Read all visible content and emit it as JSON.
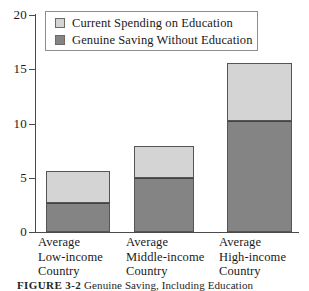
{
  "chart_data": {
    "type": "bar",
    "subtype": "stacked",
    "title": "",
    "xlabel": "",
    "ylabel": "",
    "ylim": [
      0,
      20
    ],
    "yticks": [
      0,
      5,
      10,
      15,
      20
    ],
    "ytick_labels": [
      "0",
      "5",
      "10",
      "15",
      "20"
    ],
    "grid": false,
    "legend_position": "top-left",
    "categories": [
      "Average Low-income Country",
      "Average Middle-income Country",
      "Average High-income Country"
    ],
    "category_lines": [
      [
        "Average",
        "Low-income",
        "Country"
      ],
      [
        "Average",
        "Middle-income",
        "Country"
      ],
      [
        "Average",
        "High-income",
        "Country"
      ]
    ],
    "series": [
      {
        "name": "Genuine Saving Without Education",
        "color": "#848484",
        "values": [
          2.7,
          5.0,
          10.2
        ]
      },
      {
        "name": "Current Spending on Education",
        "color": "#d4d4d4",
        "values": [
          2.9,
          2.9,
          5.4
        ]
      }
    ],
    "totals": [
      5.6,
      7.9,
      15.6
    ]
  },
  "legend": {
    "items": [
      {
        "label": "Current Spending on Education",
        "color": "#d4d4d4"
      },
      {
        "label": "Genuine Saving Without Education",
        "color": "#848484"
      }
    ]
  },
  "axis": {
    "y_ticks": [
      {
        "label": "20",
        "value": 20
      },
      {
        "label": "15",
        "value": 15
      },
      {
        "label": "10",
        "value": 10
      },
      {
        "label": "5",
        "value": 5
      },
      {
        "label": "0",
        "value": 0
      }
    ]
  },
  "caption": {
    "figure_number": "FIGURE 3-2",
    "text": "Genuine Saving, Including Education"
  },
  "colors": {
    "light_segment": "#d4d4d4",
    "dark_segment": "#848484",
    "axis": "#4a4a4a",
    "border": "#555555",
    "background": "#ffffff"
  }
}
